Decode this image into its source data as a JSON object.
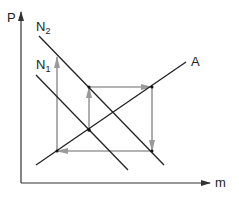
{
  "axes": {
    "y_label": "P",
    "x_label": "m"
  },
  "lines": {
    "n2": {
      "label": "N",
      "sub": "2"
    },
    "n1": {
      "label": "N",
      "sub": "1"
    },
    "a": {
      "label": "A"
    }
  },
  "colors": {
    "axis": "#333333",
    "line": "#222222",
    "path": "#9a9a9a"
  }
}
